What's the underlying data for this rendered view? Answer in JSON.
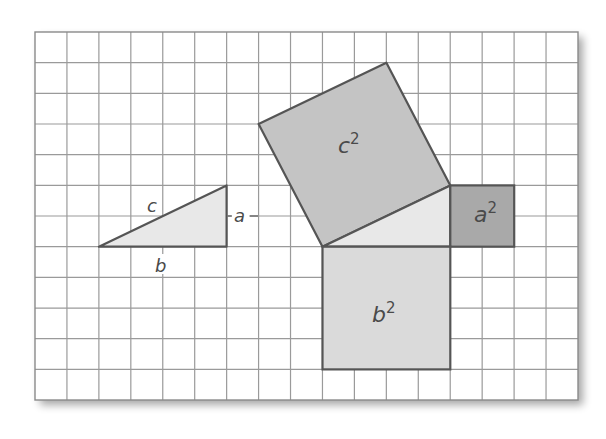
{
  "figure": {
    "grid": {
      "columns": 17,
      "rows": 12,
      "x0": 35,
      "y0": 32,
      "cell_w": 31.94,
      "cell_h": 30.67,
      "line_color": "#9a9a9a",
      "border_color": "#8a8a8a"
    },
    "colors": {
      "triangle_fill": "#e8e8e8",
      "c2_fill": "#c4c4c4",
      "a2_fill": "#a9a9a9",
      "b2_fill": "#dadada",
      "edge": "#555555",
      "label": "#4a4a4a"
    },
    "labels": {
      "small_c": "c",
      "small_a": "a",
      "small_b": "b",
      "c2_base": "c",
      "c2_exp": "2",
      "a2_base": "a",
      "a2_exp": "2",
      "b2_base": "b",
      "b2_exp": "2"
    },
    "shapes": {
      "small_triangle": {
        "points_grid": [
          [
            2,
            7
          ],
          [
            6,
            7
          ],
          [
            6,
            5
          ]
        ],
        "a": 2,
        "b": 4
      },
      "big_triangle": {
        "points_grid": [
          [
            9,
            7
          ],
          [
            13,
            7
          ],
          [
            13,
            5
          ]
        ]
      },
      "square_a2": {
        "points_grid": [
          [
            13,
            5
          ],
          [
            15,
            5
          ],
          [
            15,
            7
          ],
          [
            13,
            7
          ]
        ],
        "area": 4
      },
      "square_b2": {
        "points_grid": [
          [
            9,
            7
          ],
          [
            13,
            7
          ],
          [
            13,
            11
          ],
          [
            9,
            11
          ]
        ],
        "area": 16
      },
      "square_c2": {
        "points_grid": [
          [
            9,
            7
          ],
          [
            13,
            5
          ],
          [
            11,
            1
          ],
          [
            7,
            3
          ]
        ],
        "area": 20
      }
    }
  }
}
